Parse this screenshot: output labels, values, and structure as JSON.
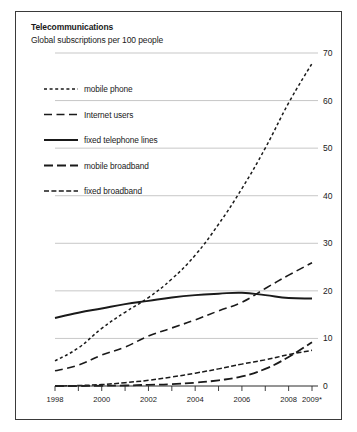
{
  "chart_data": {
    "type": "line",
    "title": "Telecommunications",
    "subtitle": "Global subscriptions per 100 people",
    "xlabel": "",
    "ylabel": "",
    "ylim": [
      0,
      70
    ],
    "yticks": [
      0,
      10,
      20,
      30,
      40,
      50,
      60,
      70
    ],
    "xlim": [
      1998,
      2009
    ],
    "xticks": [
      1998,
      1999,
      2000,
      2001,
      2002,
      2003,
      2004,
      2005,
      2006,
      2007,
      2008,
      2009
    ],
    "xtick_labels": [
      "1998",
      "",
      "2000",
      "",
      "2002",
      "",
      "2004",
      "",
      "2006",
      "",
      "2008",
      "2009*"
    ],
    "grid": "horizontal",
    "legend_position": "upper-left",
    "footnote_marker": "*",
    "x": [
      1998,
      1999,
      2000,
      2001,
      2002,
      2003,
      2004,
      2005,
      2006,
      2007,
      2008,
      2009
    ],
    "series": [
      {
        "name": "mobile phone",
        "style": "short-dash",
        "values": [
          5.3,
          8.0,
          12.1,
          15.5,
          18.6,
          22.5,
          27.5,
          34.0,
          41.5,
          50.0,
          59.5,
          67.8
        ]
      },
      {
        "name": "Internet users",
        "style": "long-dash",
        "values": [
          3.2,
          4.4,
          6.5,
          8.2,
          10.5,
          12.2,
          13.9,
          15.8,
          17.6,
          20.5,
          23.3,
          25.9
        ]
      },
      {
        "name": "fixed telephone lines",
        "style": "solid",
        "values": [
          14.3,
          15.4,
          16.3,
          17.2,
          17.9,
          18.6,
          19.1,
          19.4,
          19.6,
          19.1,
          18.5,
          18.4
        ]
      },
      {
        "name": "mobile broadband",
        "style": "long-dash-thick",
        "values": [
          0.0,
          0.0,
          0.05,
          0.1,
          0.25,
          0.4,
          0.7,
          1.2,
          2.0,
          3.6,
          6.1,
          9.2
        ]
      },
      {
        "name": "fixed broadband",
        "style": "dash-dot",
        "values": [
          0.0,
          0.1,
          0.3,
          0.7,
          1.2,
          1.9,
          2.7,
          3.6,
          4.6,
          5.5,
          6.6,
          7.5
        ]
      }
    ]
  },
  "legend": {
    "items": [
      {
        "label": "mobile phone"
      },
      {
        "label": "Internet users"
      },
      {
        "label": "fixed telephone lines"
      },
      {
        "label": "mobile broadband"
      },
      {
        "label": "fixed broadband"
      }
    ]
  }
}
